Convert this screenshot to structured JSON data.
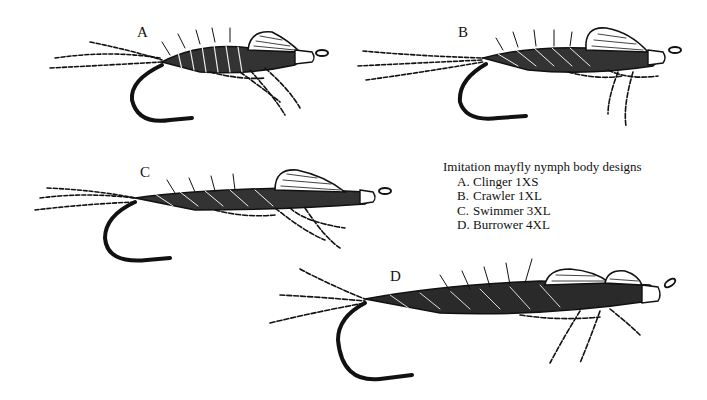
{
  "figure": {
    "labels": {
      "A": "A",
      "B": "B",
      "C": "C",
      "D": "D"
    },
    "legend": {
      "title": "Imitation mayfly nymph body designs",
      "items": [
        {
          "letter": "A.",
          "text": "Clinger 1XS"
        },
        {
          "letter": "B.",
          "text": "Crawler 1XL"
        },
        {
          "letter": "C.",
          "text": "Swimmer 3XL"
        },
        {
          "letter": "D.",
          "text": "Burrower 4XL"
        }
      ]
    },
    "style": {
      "ink": "#111111",
      "paper": "#ffffff"
    }
  }
}
